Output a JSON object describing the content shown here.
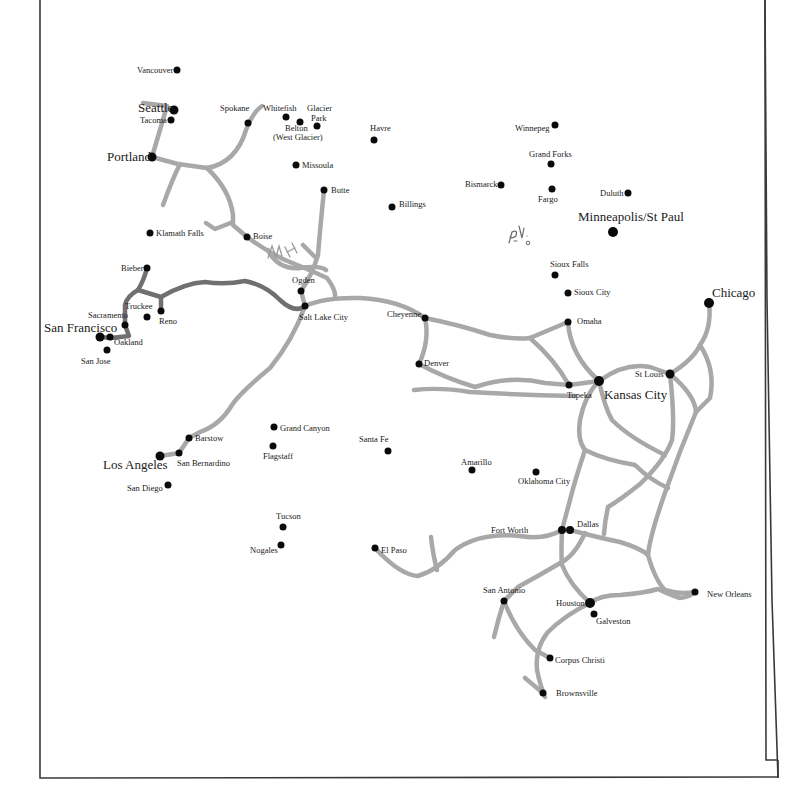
{
  "map": {
    "title": "",
    "frame": {
      "x": 40,
      "y": 22,
      "width": 727,
      "height": 756,
      "color": "#3a3a3a"
    },
    "colors": {
      "rail_primary": "#a8a8a8",
      "rail_highlight": "#707070",
      "city": "#0a0a0a",
      "text": "#1a1a1a"
    },
    "annotations": [
      {
        "id": "handwritten-mh",
        "text": "MH",
        "x": 272,
        "y": 253
      },
      {
        "id": "handwritten-pv",
        "text": "P.V.",
        "x": 512,
        "y": 238
      }
    ],
    "cities": [
      {
        "name": "Vancouver",
        "x": 177,
        "y": 70,
        "r": 3.5,
        "lx": 137,
        "ly": 73,
        "major": false
      },
      {
        "name": "Seattle",
        "x": 174,
        "y": 110,
        "r": 4.5,
        "lx": 138,
        "ly": 112,
        "major": true
      },
      {
        "name": "Tacoma",
        "x": 171,
        "y": 120,
        "r": 3.5,
        "lx": 140,
        "ly": 123,
        "major": false
      },
      {
        "name": "Portland",
        "x": 152,
        "y": 157,
        "r": 4.5,
        "lx": 107,
        "ly": 161,
        "major": true
      },
      {
        "name": "Spokane",
        "x": 248,
        "y": 123,
        "r": 3.5,
        "lx": 220,
        "ly": 111,
        "major": false
      },
      {
        "name": "Whitefish",
        "x": 286,
        "y": 117,
        "r": 3.5,
        "lx": 263,
        "ly": 111,
        "major": false
      },
      {
        "name": "Glacier",
        "x": 317,
        "y": 126,
        "r": 3.5,
        "lx": 307,
        "ly": 111,
        "major": false
      },
      {
        "name": "Park",
        "x": null,
        "y": null,
        "r": 0,
        "lx": 311,
        "ly": 121,
        "major": false
      },
      {
        "name": "Belton",
        "x": 300,
        "y": 122,
        "r": 3.5,
        "lx": 285,
        "ly": 131,
        "major": false
      },
      {
        "name": "(West Glacier)",
        "x": null,
        "y": null,
        "r": 0,
        "lx": 273,
        "ly": 140,
        "major": false
      },
      {
        "name": "Missoula",
        "x": 296,
        "y": 165,
        "r": 3.5,
        "lx": 302,
        "ly": 168,
        "major": false
      },
      {
        "name": "Havre",
        "x": 374,
        "y": 140,
        "r": 3.5,
        "lx": 370,
        "ly": 131,
        "major": false
      },
      {
        "name": "Butte",
        "x": 324,
        "y": 190,
        "r": 3.5,
        "lx": 331,
        "ly": 193,
        "major": false
      },
      {
        "name": "Billings",
        "x": 392,
        "y": 207,
        "r": 3.5,
        "lx": 399,
        "ly": 207,
        "major": false
      },
      {
        "name": "Klamath Falls",
        "x": 150,
        "y": 233,
        "r": 3.5,
        "lx": 156,
        "ly": 236,
        "major": false
      },
      {
        "name": "Boise",
        "x": 247,
        "y": 237,
        "r": 3.5,
        "lx": 253,
        "ly": 239,
        "major": false
      },
      {
        "name": "Bieber",
        "x": 147,
        "y": 268,
        "r": 3.5,
        "lx": 121,
        "ly": 271,
        "major": false
      },
      {
        "name": "Ogden",
        "x": 301,
        "y": 291,
        "r": 3.5,
        "lx": 292,
        "ly": 283,
        "major": false
      },
      {
        "name": "Salt Lake City",
        "x": 305,
        "y": 306,
        "r": 3.5,
        "lx": 299,
        "ly": 320,
        "major": false
      },
      {
        "name": "Truckee",
        "x": 147,
        "y": 317,
        "r": 3.5,
        "lx": 125,
        "ly": 309,
        "major": false
      },
      {
        "name": "Reno",
        "x": 161,
        "y": 311,
        "r": 3.5,
        "lx": 159,
        "ly": 324,
        "major": false
      },
      {
        "name": "Sacramento",
        "x": 125,
        "y": 325,
        "r": 3.5,
        "lx": 88,
        "ly": 318,
        "major": false
      },
      {
        "name": "San Francisco",
        "x": 100,
        "y": 337,
        "r": 4.5,
        "lx": 44,
        "ly": 332,
        "major": true
      },
      {
        "name": "Oakland",
        "x": 110,
        "y": 337,
        "r": 3.5,
        "lx": 114,
        "ly": 345,
        "major": false
      },
      {
        "name": "San Jose",
        "x": 107,
        "y": 350,
        "r": 3.5,
        "lx": 81,
        "ly": 364,
        "major": false
      },
      {
        "name": "Winnepeg",
        "x": 555,
        "y": 125,
        "r": 3.5,
        "lx": 515,
        "ly": 131,
        "major": false
      },
      {
        "name": "Grand Forks",
        "x": 551,
        "y": 164,
        "r": 3.5,
        "lx": 529,
        "ly": 157,
        "major": false
      },
      {
        "name": "Bismarck",
        "x": 501,
        "y": 185,
        "r": 3.5,
        "lx": 465,
        "ly": 187,
        "major": false
      },
      {
        "name": "Fargo",
        "x": 552,
        "y": 189,
        "r": 3.5,
        "lx": 538,
        "ly": 202,
        "major": false
      },
      {
        "name": "Duluth",
        "x": 628,
        "y": 193,
        "r": 3.5,
        "lx": 600,
        "ly": 196,
        "major": false
      },
      {
        "name": "Minneapolis/St Paul",
        "x": 613,
        "y": 232,
        "r": 5,
        "lx": 578,
        "ly": 221,
        "major": true
      },
      {
        "name": "Sioux Falls",
        "x": 555,
        "y": 275,
        "r": 3.5,
        "lx": 550,
        "ly": 267,
        "major": false
      },
      {
        "name": "Sioux City",
        "x": 568,
        "y": 293,
        "r": 3.5,
        "lx": 574,
        "ly": 295,
        "major": false
      },
      {
        "name": "Chicago",
        "x": 709,
        "y": 303,
        "r": 5,
        "lx": 712,
        "ly": 297,
        "major": true
      },
      {
        "name": "Cheyenne",
        "x": 425,
        "y": 318,
        "r": 3.5,
        "lx": 387,
        "ly": 317,
        "major": false
      },
      {
        "name": "Omaha",
        "x": 568,
        "y": 322,
        "r": 3.5,
        "lx": 577,
        "ly": 324,
        "major": false
      },
      {
        "name": "Denver",
        "x": 419,
        "y": 364,
        "r": 3.5,
        "lx": 424,
        "ly": 366,
        "major": false
      },
      {
        "name": "St Louis",
        "x": 670,
        "y": 374,
        "r": 4.5,
        "lx": 635,
        "ly": 377,
        "major": false
      },
      {
        "name": "Topeka",
        "x": 569,
        "y": 385,
        "r": 3.5,
        "lx": 567,
        "ly": 398,
        "major": false
      },
      {
        "name": "Kansas City",
        "x": 599,
        "y": 381,
        "r": 5,
        "lx": 604,
        "ly": 399,
        "major": true
      },
      {
        "name": "Grand Canyon",
        "x": 274,
        "y": 427,
        "r": 3.5,
        "lx": 280,
        "ly": 431,
        "major": false
      },
      {
        "name": "Barstow",
        "x": 189,
        "y": 438,
        "r": 3.5,
        "lx": 195,
        "ly": 441,
        "major": false
      },
      {
        "name": "Flagstaff",
        "x": 273,
        "y": 446,
        "r": 3.5,
        "lx": 263,
        "ly": 459,
        "major": false
      },
      {
        "name": "Santa Fe",
        "x": 388,
        "y": 451,
        "r": 3.5,
        "lx": 359,
        "ly": 442,
        "major": false
      },
      {
        "name": "Los Angeles",
        "x": 160,
        "y": 456,
        "r": 4.5,
        "lx": 103,
        "ly": 469,
        "major": true
      },
      {
        "name": "San Bernardino",
        "x": 179,
        "y": 453,
        "r": 3.5,
        "lx": 177,
        "ly": 466,
        "major": false
      },
      {
        "name": "Amarillo",
        "x": 472,
        "y": 470,
        "r": 3.5,
        "lx": 461,
        "ly": 465,
        "major": false
      },
      {
        "name": "Oklahoma City",
        "x": 536,
        "y": 472,
        "r": 3.5,
        "lx": 518,
        "ly": 484,
        "major": false
      },
      {
        "name": "San Diego",
        "x": 168,
        "y": 485,
        "r": 3.5,
        "lx": 127,
        "ly": 491,
        "major": false
      },
      {
        "name": "Tucson",
        "x": 283,
        "y": 527,
        "r": 3.5,
        "lx": 276,
        "ly": 519,
        "major": false
      },
      {
        "name": "Fort Worth",
        "x": 562,
        "y": 530,
        "r": 4,
        "lx": 491,
        "ly": 533,
        "major": false
      },
      {
        "name": "Dallas",
        "x": 570,
        "y": 530,
        "r": 4,
        "lx": 577,
        "ly": 527,
        "major": false
      },
      {
        "name": "Nogales",
        "x": 281,
        "y": 545,
        "r": 3.5,
        "lx": 250,
        "ly": 553,
        "major": false
      },
      {
        "name": "El Paso",
        "x": 375,
        "y": 548,
        "r": 3.5,
        "lx": 381,
        "ly": 553,
        "major": false
      },
      {
        "name": "San Antonio",
        "x": 504,
        "y": 601,
        "r": 3.5,
        "lx": 483,
        "ly": 593,
        "major": false
      },
      {
        "name": "New Orleans",
        "x": 695,
        "y": 592,
        "r": 3.5,
        "lx": 707,
        "ly": 597,
        "major": false
      },
      {
        "name": "Houston",
        "x": 590,
        "y": 603,
        "r": 5,
        "lx": 556,
        "ly": 606,
        "major": false
      },
      {
        "name": "Galveston",
        "x": 594,
        "y": 614,
        "r": 3.5,
        "lx": 596,
        "ly": 624,
        "major": false
      },
      {
        "name": "Corpus Christi",
        "x": 550,
        "y": 658,
        "r": 3.5,
        "lx": 555,
        "ly": 663,
        "major": false
      },
      {
        "name": "Brownsville",
        "x": 543,
        "y": 693,
        "r": 3.5,
        "lx": 556,
        "ly": 696,
        "major": false
      }
    ]
  }
}
